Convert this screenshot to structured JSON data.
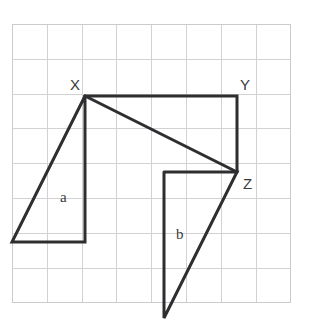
{
  "figure": {
    "canvas": {
      "width": 310,
      "height": 332,
      "background": "#ffffff"
    },
    "grid": {
      "origin_x": 12,
      "origin_y": 24,
      "cell_size": 34.8,
      "cols": 8,
      "rows": 8,
      "line_color": "#d2d2d4",
      "border_color": "#cbcbcd",
      "visible": true
    },
    "stroke_color": "#2e2e30",
    "stroke_width": 3,
    "vertex_labels": [
      {
        "id": "label-X",
        "text": "X",
        "x": 70,
        "y": 90
      },
      {
        "id": "label-Y",
        "text": "Y",
        "x": 240,
        "y": 90
      },
      {
        "id": "label-Z",
        "text": "Z",
        "x": 243,
        "y": 189
      }
    ],
    "region_labels": [
      {
        "id": "label-a",
        "text": "a",
        "x": 60,
        "y": 202
      },
      {
        "id": "label-b",
        "text": "b",
        "x": 176,
        "y": 239
      }
    ],
    "vertices": {
      "X": {
        "x": 85,
        "y": 96
      },
      "Y": {
        "x": 237,
        "y": 96
      },
      "Z": {
        "x": 237,
        "y": 172
      },
      "a_bottom_left": {
        "x": 12,
        "y": 242
      },
      "a_bottom_right": {
        "x": 85,
        "y": 242
      },
      "b_top_left": {
        "x": 164,
        "y": 172
      },
      "b_bottom": {
        "x": 164,
        "y": 318
      }
    },
    "shapes": [
      {
        "id": "shape-a-triangle",
        "name": "triangle-a",
        "label": "a",
        "points": "85,96 12,242 85,242 85,96"
      },
      {
        "id": "shape-xyz-rectangle",
        "name": "rectangle-xyz",
        "points": "85,96 237,96 237,172"
      },
      {
        "id": "shape-xz-diagonal",
        "name": "diagonal-x-to-z",
        "points": "85,96 237,172"
      },
      {
        "id": "shape-b-triangle",
        "name": "triangle-b",
        "label": "b",
        "points": "164,172 237,172 164,318 164,172"
      }
    ]
  }
}
